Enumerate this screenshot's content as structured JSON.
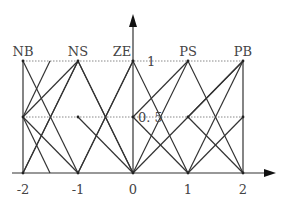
{
  "diagram": {
    "sets": [
      {
        "label": "NB",
        "peak": -2
      },
      {
        "label": "NS",
        "peak": -1
      },
      {
        "label": "ZE",
        "peak": 0
      },
      {
        "label": "PS",
        "peak": 1
      },
      {
        "label": "PB",
        "peak": 2
      }
    ],
    "x_ticks": [
      "-2",
      "-1",
      "0",
      "1",
      "2"
    ],
    "y_labels": {
      "one": "1",
      "half": "0. 5"
    },
    "colors": {
      "line": "#333333",
      "dotted": "#777777",
      "text": "#444444"
    }
  }
}
